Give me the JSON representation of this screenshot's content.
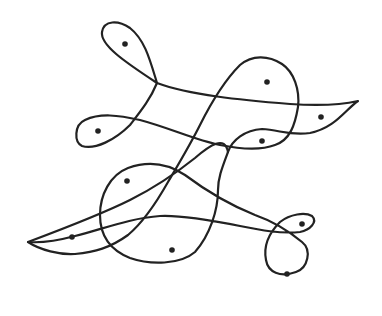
{
  "diagram": {
    "type": "hand-drawn closed curve with marked regions",
    "stroke_color": "#222222",
    "background": "#ffffff",
    "dots": [
      {
        "x": 125,
        "y": 44
      },
      {
        "x": 267,
        "y": 82
      },
      {
        "x": 321,
        "y": 117
      },
      {
        "x": 98,
        "y": 131
      },
      {
        "x": 262,
        "y": 141
      },
      {
        "x": 127,
        "y": 181
      },
      {
        "x": 302,
        "y": 224
      },
      {
        "x": 72,
        "y": 237
      },
      {
        "x": 172,
        "y": 250
      },
      {
        "x": 287,
        "y": 274
      }
    ]
  }
}
